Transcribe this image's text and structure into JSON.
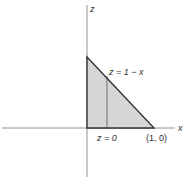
{
  "diagram": {
    "axes": {
      "vertical_label": "z",
      "horizontal_label": "x"
    },
    "region": {
      "description": "triangle bounded by z = 1 - x, z = 0, and the z-axis",
      "fill_color": "#d6d6d6",
      "edge_color": "#333333"
    },
    "labels": {
      "hypotenuse": "z = 1 − x",
      "base": "z = 0",
      "point": "(1, 0)"
    }
  }
}
